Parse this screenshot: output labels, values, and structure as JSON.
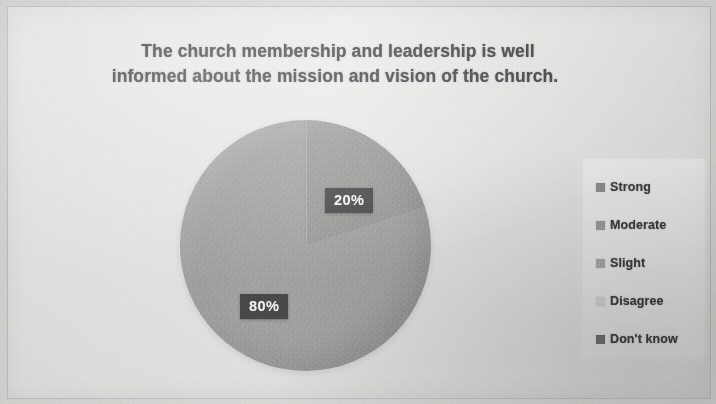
{
  "slide": {
    "title_line1": "The church membership and leadership is well",
    "title_line2": "informed about the mission and vision of the church."
  },
  "chart_data": {
    "type": "pie",
    "title": "The church membership and leadership is well informed about the mission and vision of the church.",
    "categories": [
      "Strong",
      "Moderate",
      "Slight",
      "Disagree",
      "Don't know"
    ],
    "values": [
      20,
      80,
      0,
      0,
      0
    ],
    "data_labels": [
      "20%",
      "80%"
    ],
    "units": "percent",
    "legend_position": "right",
    "grid": false,
    "start_angle_deg": 0,
    "slice_colors": [
      "#949492",
      "#9d9d9b",
      "#8f8f8d",
      "#cfcfcd",
      "#6d6d6b"
    ],
    "label_20": "20%",
    "label_80": "80%"
  },
  "legend": {
    "items": [
      {
        "label": "Strong",
        "color": "#8c8c8a"
      },
      {
        "label": "Moderate",
        "color": "#9a9a98"
      },
      {
        "label": "Slight",
        "color": "#a6a6a4"
      },
      {
        "label": "Disagree",
        "color": "#cfcfcd"
      },
      {
        "label": "Don't know",
        "color": "#6d6d6b"
      }
    ]
  }
}
